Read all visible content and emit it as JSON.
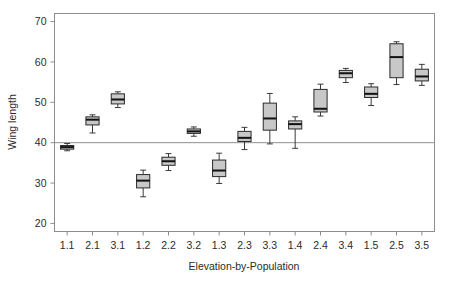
{
  "chart_data": {
    "type": "box",
    "title": "",
    "xlabel": "Elevation-by-Population",
    "ylabel": "Wing length",
    "ylim": [
      18,
      72
    ],
    "yticks": [
      20,
      30,
      40,
      50,
      60,
      70
    ],
    "ytick_labels": [
      "20",
      "30",
      "40",
      "50",
      "60",
      "70"
    ],
    "grid": false,
    "legend": "none",
    "reference_line": {
      "orientation": "horizontal",
      "value": 40,
      "color": "#8f8f8f"
    },
    "categories": [
      "1.1",
      "2.1",
      "3.1",
      "1.2",
      "2.2",
      "3.2",
      "1.3",
      "2.3",
      "3.3",
      "1.4",
      "2.4",
      "3.4",
      "1.5",
      "2.5",
      "3.5"
    ],
    "boxes": [
      {
        "category": "1.1",
        "lower_whisker": 38.0,
        "q1": 38.4,
        "median": 38.9,
        "q3": 39.3,
        "upper_whisker": 39.8
      },
      {
        "category": "2.1",
        "lower_whisker": 42.4,
        "q1": 44.4,
        "median": 45.7,
        "q3": 46.4,
        "upper_whisker": 46.9
      },
      {
        "category": "3.1",
        "lower_whisker": 48.7,
        "q1": 49.6,
        "median": 50.7,
        "q3": 52.1,
        "upper_whisker": 52.6
      },
      {
        "category": "1.2",
        "lower_whisker": 26.6,
        "q1": 28.8,
        "median": 30.6,
        "q3": 32.1,
        "upper_whisker": 33.2
      },
      {
        "category": "2.2",
        "lower_whisker": 33.1,
        "q1": 34.4,
        "median": 35.4,
        "q3": 36.4,
        "upper_whisker": 37.3
      },
      {
        "category": "3.2",
        "lower_whisker": 41.6,
        "q1": 42.3,
        "median": 42.8,
        "q3": 43.4,
        "upper_whisker": 43.9
      },
      {
        "category": "1.3",
        "lower_whisker": 29.9,
        "q1": 31.6,
        "median": 33.1,
        "q3": 35.7,
        "upper_whisker": 37.4
      },
      {
        "category": "2.3",
        "lower_whisker": 38.3,
        "q1": 40.3,
        "median": 41.2,
        "q3": 42.8,
        "upper_whisker": 43.8
      },
      {
        "category": "3.3",
        "lower_whisker": 39.7,
        "q1": 43.1,
        "median": 46.0,
        "q3": 49.8,
        "upper_whisker": 52.2
      },
      {
        "category": "1.4",
        "lower_whisker": 38.6,
        "q1": 43.4,
        "median": 44.6,
        "q3": 45.4,
        "upper_whisker": 46.4
      },
      {
        "category": "2.4",
        "lower_whisker": 46.6,
        "q1": 47.6,
        "median": 48.4,
        "q3": 53.2,
        "upper_whisker": 54.5
      },
      {
        "category": "3.4",
        "lower_whisker": 54.9,
        "q1": 56.1,
        "median": 57.2,
        "q3": 57.9,
        "upper_whisker": 58.4
      },
      {
        "category": "1.5",
        "lower_whisker": 49.2,
        "q1": 51.2,
        "median": 52.1,
        "q3": 53.8,
        "upper_whisker": 54.6
      },
      {
        "category": "2.5",
        "lower_whisker": 54.4,
        "q1": 56.1,
        "median": 61.2,
        "q3": 64.5,
        "upper_whisker": 65.0
      },
      {
        "category": "3.5",
        "lower_whisker": 54.2,
        "q1": 55.3,
        "median": 56.4,
        "q3": 58.2,
        "upper_whisker": 59.4
      }
    ],
    "colors": {
      "box_fill": "#c8c8c8",
      "box_border": "#2a2a2a",
      "median": "#111111",
      "whisker": "#3a3a3a",
      "panel_border": "#8d8d8d",
      "text": "#2b2b2b",
      "background": "#ffffff"
    }
  }
}
